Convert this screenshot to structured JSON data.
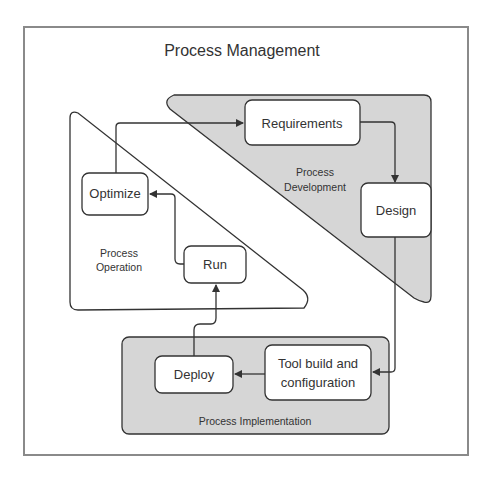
{
  "title": "Process Management",
  "colors": {
    "frame": "#8a8a8a",
    "region_fill": "#d6d6d6",
    "stroke": "#333333",
    "box_fill": "#ffffff"
  },
  "regions": {
    "development": {
      "label_line1": "Process",
      "label_line2": "Development"
    },
    "operation": {
      "label_line1": "Process",
      "label_line2": "Operation"
    },
    "implementation": {
      "label": "Process Implementation"
    }
  },
  "nodes": {
    "requirements": "Requirements",
    "design": "Design",
    "tool_line1": "Tool build and",
    "tool_line2": "configuration",
    "deploy": "Deploy",
    "run": "Run",
    "optimize": "Optimize"
  },
  "edges": [
    {
      "from": "Requirements",
      "to": "Design"
    },
    {
      "from": "Design",
      "to": "Tool build and configuration"
    },
    {
      "from": "Tool build and configuration",
      "to": "Deploy"
    },
    {
      "from": "Deploy",
      "to": "Run"
    },
    {
      "from": "Run",
      "to": "Optimize"
    },
    {
      "from": "Optimize",
      "to": "Requirements"
    }
  ]
}
